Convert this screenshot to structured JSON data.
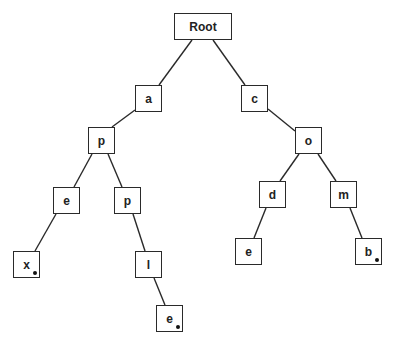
{
  "diagram": {
    "type": "trie",
    "nodes": [
      {
        "id": "root",
        "label": "Root",
        "x": 174,
        "y": 13,
        "w": 58,
        "h": 27,
        "terminal": false
      },
      {
        "id": "a",
        "label": "a",
        "x": 135,
        "y": 85,
        "w": 27,
        "h": 27,
        "terminal": false
      },
      {
        "id": "c",
        "label": "c",
        "x": 241,
        "y": 85,
        "w": 27,
        "h": 27,
        "terminal": false
      },
      {
        "id": "ap",
        "label": "p",
        "x": 88,
        "y": 127,
        "w": 27,
        "h": 27,
        "terminal": false
      },
      {
        "id": "ape",
        "label": "e",
        "x": 53,
        "y": 187,
        "w": 27,
        "h": 27,
        "terminal": false
      },
      {
        "id": "app",
        "label": "p",
        "x": 114,
        "y": 187,
        "w": 27,
        "h": 27,
        "terminal": false
      },
      {
        "id": "apex",
        "label": "x",
        "x": 13,
        "y": 251,
        "w": 27,
        "h": 27,
        "terminal": true
      },
      {
        "id": "appl",
        "label": "l",
        "x": 135,
        "y": 251,
        "w": 27,
        "h": 27,
        "terminal": false
      },
      {
        "id": "apple",
        "label": "e",
        "x": 156,
        "y": 305,
        "w": 27,
        "h": 27,
        "terminal": true
      },
      {
        "id": "co",
        "label": "o",
        "x": 295,
        "y": 127,
        "w": 27,
        "h": 27,
        "terminal": false
      },
      {
        "id": "cod",
        "label": "d",
        "x": 259,
        "y": 181,
        "w": 27,
        "h": 27,
        "terminal": false
      },
      {
        "id": "com",
        "label": "m",
        "x": 330,
        "y": 181,
        "w": 27,
        "h": 27,
        "terminal": false
      },
      {
        "id": "code",
        "label": "e",
        "x": 235,
        "y": 238,
        "w": 27,
        "h": 27,
        "terminal": false
      },
      {
        "id": "comb",
        "label": "b",
        "x": 355,
        "y": 238,
        "w": 27,
        "h": 27,
        "terminal": true
      }
    ],
    "edges": [
      {
        "from": "root",
        "to": "a",
        "x1": 192,
        "y1": 40,
        "x2": 159,
        "y2": 85
      },
      {
        "from": "root",
        "to": "c",
        "x1": 213,
        "y1": 40,
        "x2": 245,
        "y2": 85
      },
      {
        "from": "a",
        "to": "ap",
        "x1": 135,
        "y1": 110,
        "x2": 112,
        "y2": 127
      },
      {
        "from": "ap",
        "to": "ape",
        "x1": 92,
        "y1": 154,
        "x2": 74,
        "y2": 187
      },
      {
        "from": "ap",
        "to": "app",
        "x1": 108,
        "y1": 154,
        "x2": 122,
        "y2": 187
      },
      {
        "from": "ape",
        "to": "apex",
        "x1": 56,
        "y1": 214,
        "x2": 35,
        "y2": 251
      },
      {
        "from": "app",
        "to": "appl",
        "x1": 133,
        "y1": 214,
        "x2": 145,
        "y2": 251
      },
      {
        "from": "appl",
        "to": "apple",
        "x1": 154,
        "y1": 278,
        "x2": 165,
        "y2": 305
      },
      {
        "from": "c",
        "to": "co",
        "x1": 268,
        "y1": 109,
        "x2": 295,
        "y2": 131
      },
      {
        "from": "co",
        "to": "cod",
        "x1": 299,
        "y1": 154,
        "x2": 280,
        "y2": 181
      },
      {
        "from": "co",
        "to": "com",
        "x1": 318,
        "y1": 154,
        "x2": 336,
        "y2": 181
      },
      {
        "from": "cod",
        "to": "code",
        "x1": 266,
        "y1": 208,
        "x2": 254,
        "y2": 238
      },
      {
        "from": "com",
        "to": "comb",
        "x1": 350,
        "y1": 208,
        "x2": 362,
        "y2": 238
      }
    ],
    "colors": {
      "stroke": "#2a2a2a",
      "fill": "#ffffff",
      "text": "#222222",
      "terminal_dot": "#111111"
    }
  }
}
